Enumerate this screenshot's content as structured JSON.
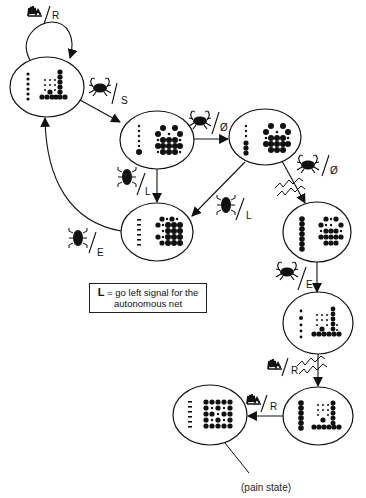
{
  "diagram": {
    "type": "state-transition",
    "states": [
      {
        "id": "s1",
        "cx": 47,
        "cy": 87,
        "rx": 37,
        "ry": 30,
        "pattern": "low-bars"
      },
      {
        "id": "s2",
        "cx": 157,
        "cy": 140,
        "rx": 37,
        "ry": 29,
        "pattern": "crab-dense"
      },
      {
        "id": "s3",
        "cx": 265,
        "cy": 137,
        "rx": 36,
        "ry": 28,
        "pattern": "crab-dense"
      },
      {
        "id": "s4",
        "cx": 157,
        "cy": 232,
        "rx": 36,
        "ry": 29,
        "pattern": "right-block"
      },
      {
        "id": "s5",
        "cx": 317,
        "cy": 232,
        "rx": 34,
        "ry": 30,
        "pattern": "column-crab"
      },
      {
        "id": "s6",
        "cx": 318,
        "cy": 323,
        "rx": 35,
        "ry": 31,
        "pattern": "low-bars"
      },
      {
        "id": "s7",
        "cx": 318,
        "cy": 416,
        "rx": 35,
        "ry": 29,
        "pattern": "column-bars"
      },
      {
        "id": "s8",
        "cx": 210,
        "cy": 415,
        "rx": 37,
        "ry": 30,
        "pattern": "pain-grid",
        "caption": "(pain state)"
      }
    ],
    "transitions": [
      {
        "from": "s1",
        "to": "s1",
        "stimulus": "noise-icon",
        "signal": "R"
      },
      {
        "from": "s1",
        "to": "s2",
        "stimulus": "crab-icon",
        "signal": "S"
      },
      {
        "from": "s2",
        "to": "s3",
        "stimulus": "crab-icon",
        "signal": "Ø"
      },
      {
        "from": "s2",
        "to": "s4",
        "stimulus": "bug-icon",
        "signal": "L"
      },
      {
        "from": "s3",
        "to": "s4",
        "stimulus": "bug-icon",
        "signal": "L"
      },
      {
        "from": "s4",
        "to": "s1",
        "stimulus": "bug-icon",
        "signal": "E"
      },
      {
        "from": "s3",
        "to": "s5",
        "stimulus": "crab-icon",
        "signal": "Ø",
        "shock": true
      },
      {
        "from": "s5",
        "to": "s6",
        "stimulus": "crab-icon",
        "signal": "E"
      },
      {
        "from": "s6",
        "to": "s7",
        "stimulus": "noise-icon",
        "signal": "R",
        "shock": true
      },
      {
        "from": "s7",
        "to": "s8",
        "stimulus": "noise-icon",
        "signal": "R"
      }
    ]
  },
  "labels": {
    "t1": "R",
    "t2": "S",
    "t3": "Ø",
    "t4": "L",
    "t5": "L",
    "t6": "E",
    "t7": "Ø",
    "t8": "E",
    "t9": "R",
    "t10": "R"
  },
  "legend": {
    "key": "L",
    "text": " = go left signal for the autonomous net"
  },
  "caption": {
    "pain_state": "(pain state)"
  },
  "colors": {
    "ink": "#111111",
    "background": "#ffffff"
  }
}
